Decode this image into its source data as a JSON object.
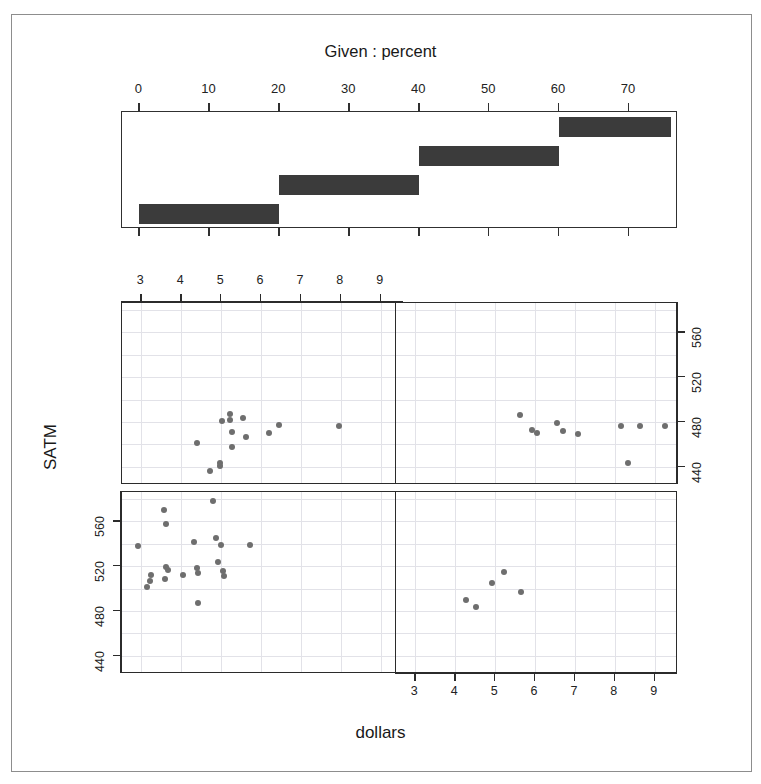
{
  "figure": {
    "given_title": "Given : percent",
    "x_axis_label": "dollars",
    "y_axis_label": "SATM",
    "point_color": "#6e6e6e",
    "bar_color": "#3b3b3b",
    "grid_color": "#e2e2e8",
    "frame_color": "#2b2b2b"
  },
  "chart_data": {
    "type": "scatter",
    "title": "Given : percent",
    "xlabel": "dollars",
    "ylabel": "SATM",
    "xlim": [
      2.55,
      9.55
    ],
    "ylim": [
      425,
      585
    ],
    "grid": true,
    "legend": null,
    "conditioning_variable": "percent",
    "conditioning_title": "Given : percent",
    "conditioning_axis": {
      "min": -2.5,
      "max": 77.0,
      "ticks": [
        0,
        10,
        20,
        30,
        40,
        50,
        60,
        70
      ],
      "tick_labels": [
        "0",
        "10",
        "20",
        "30",
        "40",
        "50",
        "60",
        "70"
      ]
    },
    "conditioning_intervals": [
      {
        "index": 1,
        "min": 0,
        "max": 20,
        "row": 0,
        "col": 0,
        "panel": "bottom-left"
      },
      {
        "index": 2,
        "min": 20,
        "max": 40,
        "row": 0,
        "col": 1,
        "panel": "bottom-right"
      },
      {
        "index": 3,
        "min": 40,
        "max": 60,
        "row": 1,
        "col": 0,
        "panel": "top-left"
      },
      {
        "index": 4,
        "min": 60,
        "max": 76,
        "row": 1,
        "col": 1,
        "panel": "top-right"
      }
    ],
    "x_ticks": [
      3,
      4,
      5,
      6,
      7,
      8,
      9
    ],
    "x_tick_labels": [
      "3",
      "4",
      "5",
      "6",
      "7",
      "8",
      "9"
    ],
    "y_ticks": [
      440,
      480,
      520,
      560
    ],
    "y_tick_labels": [
      "440",
      "480",
      "520",
      "560"
    ],
    "x_grid_values": [
      3,
      4,
      5,
      6,
      7,
      8,
      9
    ],
    "y_grid_values": [
      440,
      460,
      480,
      500,
      520,
      540,
      560,
      580
    ],
    "panels": [
      {
        "name": "top-left",
        "row": 0,
        "col": 0,
        "interval_label": "percent 40 to 60",
        "x_axis_shown": "top",
        "y_axis_shown": "right",
        "points": [
          {
            "x": 4.4,
            "y": 461
          },
          {
            "x": 4.72,
            "y": 436
          },
          {
            "x": 4.97,
            "y": 441
          },
          {
            "x": 4.98,
            "y": 443
          },
          {
            "x": 5.02,
            "y": 481
          },
          {
            "x": 5.22,
            "y": 487
          },
          {
            "x": 5.23,
            "y": 482
          },
          {
            "x": 5.27,
            "y": 458
          },
          {
            "x": 5.28,
            "y": 471
          },
          {
            "x": 5.55,
            "y": 484
          },
          {
            "x": 5.62,
            "y": 467
          },
          {
            "x": 6.2,
            "y": 470
          },
          {
            "x": 6.45,
            "y": 477
          },
          {
            "x": 7.95,
            "y": 476
          }
        ]
      },
      {
        "name": "top-right",
        "row": 0,
        "col": 1,
        "interval_label": "percent 60 to 76",
        "x_axis_shown": "none",
        "y_axis_shown": "right",
        "points": [
          {
            "x": 5.62,
            "y": 486
          },
          {
            "x": 5.92,
            "y": 473
          },
          {
            "x": 6.05,
            "y": 470
          },
          {
            "x": 6.55,
            "y": 479
          },
          {
            "x": 6.7,
            "y": 472
          },
          {
            "x": 7.08,
            "y": 469
          },
          {
            "x": 8.15,
            "y": 476
          },
          {
            "x": 8.32,
            "y": 443
          },
          {
            "x": 8.62,
            "y": 476
          },
          {
            "x": 9.25,
            "y": 476
          }
        ]
      },
      {
        "name": "bottom-left",
        "row": 1,
        "col": 0,
        "interval_label": "percent 0 to 20",
        "x_axis_shown": "none",
        "y_axis_shown": "left",
        "points": [
          {
            "x": 2.92,
            "y": 538
          },
          {
            "x": 3.25,
            "y": 512
          },
          {
            "x": 3.22,
            "y": 507
          },
          {
            "x": 3.15,
            "y": 501
          },
          {
            "x": 3.58,
            "y": 570
          },
          {
            "x": 3.62,
            "y": 558
          },
          {
            "x": 3.62,
            "y": 519
          },
          {
            "x": 3.66,
            "y": 517
          },
          {
            "x": 3.6,
            "y": 509
          },
          {
            "x": 4.05,
            "y": 512
          },
          {
            "x": 4.32,
            "y": 542
          },
          {
            "x": 4.4,
            "y": 518
          },
          {
            "x": 4.41,
            "y": 514
          },
          {
            "x": 4.43,
            "y": 487
          },
          {
            "x": 4.8,
            "y": 578
          },
          {
            "x": 4.88,
            "y": 545
          },
          {
            "x": 4.92,
            "y": 524
          },
          {
            "x": 5.0,
            "y": 539
          },
          {
            "x": 5.05,
            "y": 516
          },
          {
            "x": 5.06,
            "y": 511
          },
          {
            "x": 5.72,
            "y": 539
          }
        ]
      },
      {
        "name": "bottom-right",
        "row": 1,
        "col": 1,
        "interval_label": "percent 20 to 40",
        "x_axis_shown": "bottom",
        "y_axis_shown": "left",
        "points": [
          {
            "x": 4.28,
            "y": 490
          },
          {
            "x": 4.52,
            "y": 484
          },
          {
            "x": 4.92,
            "y": 505
          },
          {
            "x": 5.22,
            "y": 515
          },
          {
            "x": 5.65,
            "y": 497
          }
        ]
      }
    ]
  }
}
